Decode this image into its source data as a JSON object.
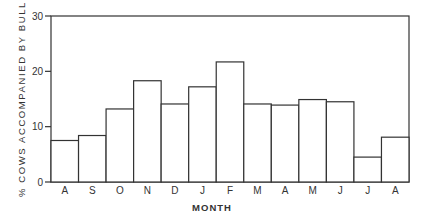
{
  "chart_data": {
    "type": "bar",
    "title": "",
    "xlabel": "MONTH",
    "ylabel": "% COWS ACCOMPANIED BY BULL",
    "ylim": [
      0,
      30
    ],
    "yticks": [
      0,
      10,
      20,
      30
    ],
    "grid": false,
    "legend": null,
    "categories": [
      "A",
      "S",
      "O",
      "N",
      "D",
      "J",
      "F",
      "M",
      "A",
      "M",
      "J",
      "J",
      "A"
    ],
    "values": [
      7.5,
      8.4,
      13.2,
      18.3,
      14.1,
      17.2,
      21.7,
      14.1,
      13.9,
      14.9,
      14.5,
      4.5,
      8.1
    ]
  },
  "colors": {
    "bar_fill": "#ffffff",
    "bar_stroke": "#333333",
    "axis": "#333333"
  }
}
